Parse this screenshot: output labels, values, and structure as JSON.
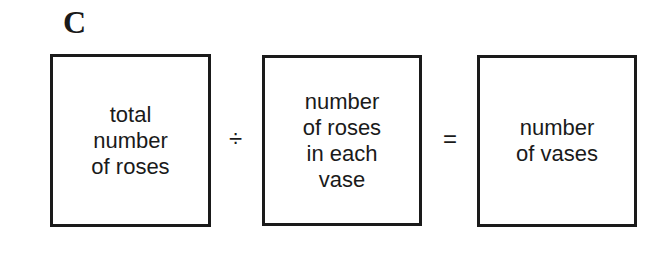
{
  "panel_label": "C",
  "equation": {
    "boxes": [
      {
        "lines": [
          "total",
          "number",
          "of roses"
        ]
      },
      {
        "lines": [
          "number",
          "of roses",
          "in each",
          "vase"
        ]
      },
      {
        "lines": [
          "number",
          "of vases"
        ]
      }
    ],
    "operators": [
      "÷",
      "="
    ]
  }
}
